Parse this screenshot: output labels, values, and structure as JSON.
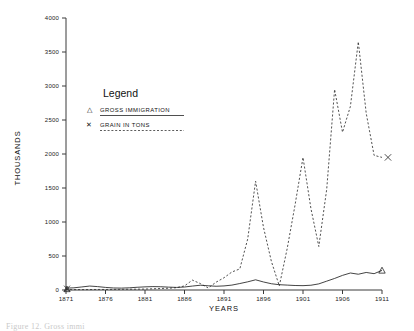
{
  "figure": {
    "caption": "Figure 12.  Gross immi"
  },
  "legend": {
    "title": "Legend",
    "entries": [
      {
        "marker": "triangle-up",
        "marker_glyph": "△",
        "label": "GROSS IMMIGRATION",
        "line_style": "solid"
      },
      {
        "marker": "cross",
        "marker_glyph": "✕",
        "label": "GRAIN IN TONS",
        "line_style": "dashed"
      }
    ]
  },
  "chart_data": {
    "type": "line",
    "title": "",
    "xlabel": "YEARS",
    "ylabel": "THOUSANDS",
    "xlim": [
      1871,
      1911
    ],
    "ylim": [
      0,
      4000
    ],
    "grid": false,
    "legend_position": "upper-left-inside",
    "x_ticks": [
      "1871",
      "1876",
      "1881",
      "1886",
      "1891",
      "1896",
      "1901",
      "1906",
      "1911"
    ],
    "y_ticks": [
      "0",
      "500",
      "1000",
      "1500",
      "2000",
      "2500",
      "3000",
      "3500",
      "4000"
    ],
    "x": [
      1871,
      1872,
      1873,
      1874,
      1875,
      1876,
      1877,
      1878,
      1879,
      1880,
      1881,
      1882,
      1883,
      1884,
      1885,
      1886,
      1887,
      1888,
      1889,
      1890,
      1891,
      1892,
      1893,
      1894,
      1895,
      1896,
      1897,
      1898,
      1899,
      1900,
      1901,
      1902,
      1903,
      1904,
      1905,
      1906,
      1907,
      1908,
      1909,
      1910,
      1911
    ],
    "series": [
      {
        "name": "GROSS IMMIGRATION",
        "marker": "triangle-up",
        "line_style": "solid",
        "values": [
          28,
          32,
          45,
          58,
          50,
          38,
          30,
          28,
          32,
          40,
          46,
          50,
          48,
          42,
          38,
          44,
          58,
          70,
          62,
          55,
          60,
          72,
          95,
          120,
          150,
          118,
          92,
          78,
          72,
          66,
          64,
          70,
          90,
          130,
          170,
          215,
          250,
          232,
          258,
          240,
          288
        ]
      },
      {
        "name": "GRAIN IN TONS",
        "marker": "cross",
        "line_style": "dashed",
        "values": [
          5,
          6,
          6,
          7,
          8,
          8,
          9,
          10,
          11,
          12,
          14,
          18,
          22,
          26,
          34,
          60,
          145,
          95,
          30,
          115,
          180,
          265,
          310,
          750,
          1600,
          920,
          420,
          60,
          610,
          1255,
          1950,
          1200,
          640,
          1480,
          2950,
          2320,
          2700,
          3650,
          2600,
          1980,
          1950
        ]
      }
    ],
    "annotations": [
      {
        "text": "end-marker-cross",
        "x": 1911,
        "y": 1950
      },
      {
        "text": "end-marker-triangle",
        "x": 1911,
        "y": 288
      }
    ]
  }
}
